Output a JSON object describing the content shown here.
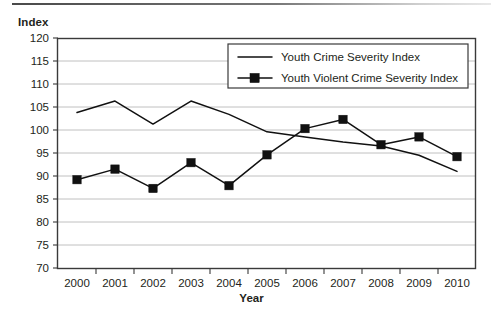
{
  "axes": {
    "ylabel": "Index",
    "xlabel": "Year"
  },
  "legend": {
    "items": [
      {
        "label": "Youth Crime Severity Index",
        "marker": "none"
      },
      {
        "label": "Youth Violent Crime Severity Index",
        "marker": "square"
      }
    ]
  },
  "chart_data": {
    "type": "line",
    "title": "",
    "xlabel": "Year",
    "ylabel": "Index",
    "categories": [
      "2000",
      "2001",
      "2002",
      "2003",
      "2004",
      "2005",
      "2006",
      "2007",
      "2008",
      "2009",
      "2010"
    ],
    "ylim": [
      70,
      120
    ],
    "yticks": [
      70,
      75,
      80,
      85,
      90,
      95,
      100,
      105,
      110,
      115,
      120
    ],
    "grid": true,
    "legend_position": "top-right",
    "series": [
      {
        "name": "Youth Crime Severity Index",
        "marker": "none",
        "color": "#111111",
        "values": [
          103.8,
          106.3,
          101.3,
          106.3,
          103.4,
          99.6,
          98.5,
          97.4,
          96.5,
          94.5,
          91.0
        ]
      },
      {
        "name": "Youth Violent Crime Severity Index",
        "marker": "square",
        "color": "#111111",
        "values": [
          89.2,
          91.5,
          87.3,
          92.9,
          87.9,
          94.6,
          100.3,
          102.3,
          96.8,
          98.5,
          94.2
        ]
      }
    ]
  }
}
